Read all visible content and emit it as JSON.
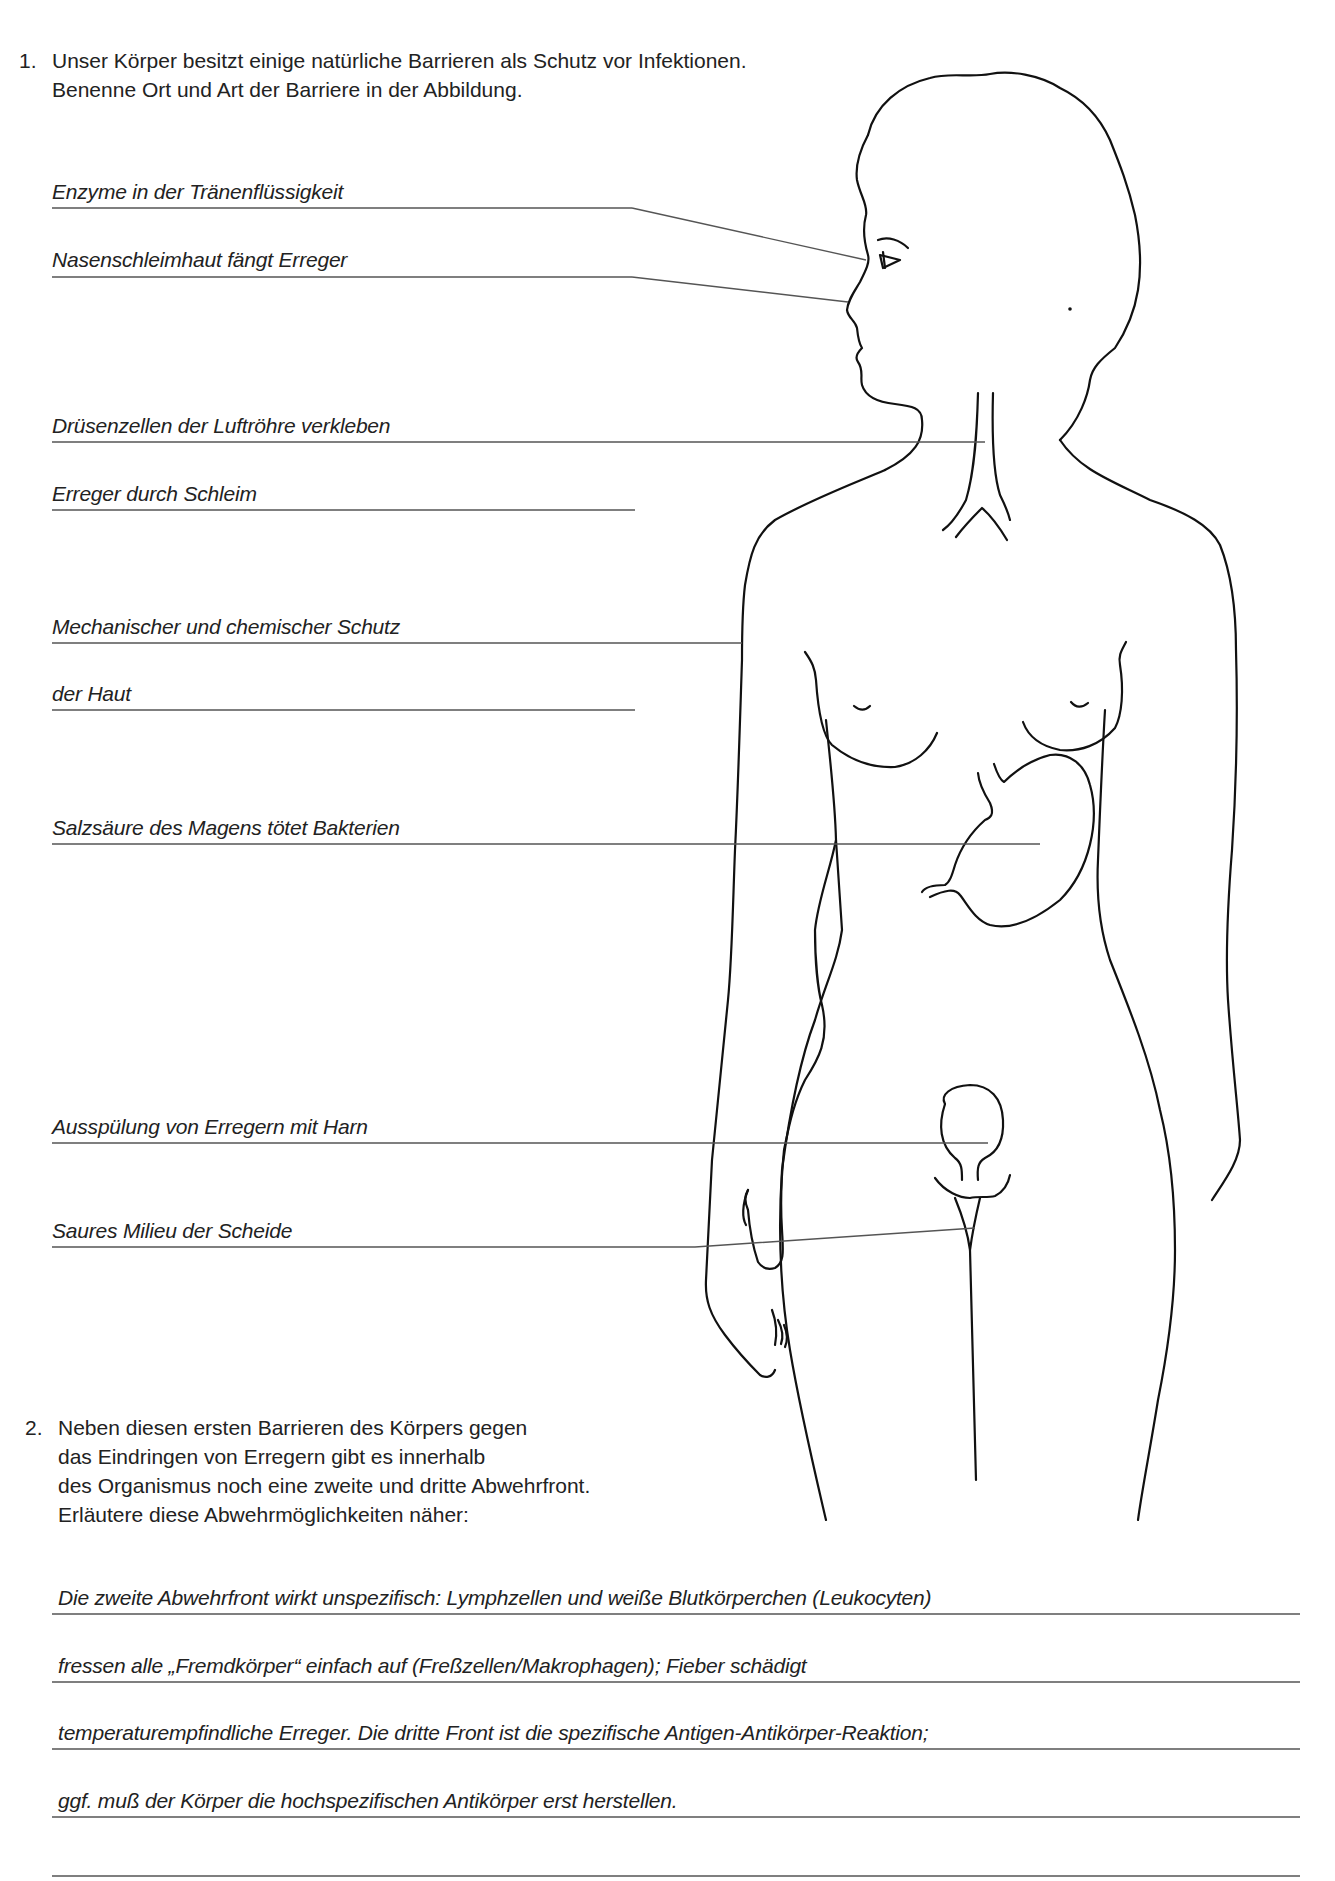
{
  "task1": {
    "number": "1.",
    "lines": [
      "Unser Körper besitzt einige natürliche Barrieren als Schutz vor Infektionen.",
      "Benenne Ort und Art der Barriere in der Abbildung."
    ],
    "answers": [
      "Enzyme in der Tränenflüssigkeit",
      "Nasenschleimhaut fängt Erreger",
      "Drüsenzellen der Luftröhre verkleben",
      "Erreger durch Schleim",
      "Mechanischer und chemischer Schutz",
      "der Haut",
      "Salzsäure des Magens tötet Bakterien",
      "Ausspülung von Erregern mit Harn",
      "Saures Milieu der Scheide"
    ]
  },
  "task2": {
    "number": "2.",
    "lines": [
      "Neben diesen ersten Barrieren des Körpers gegen",
      "das Eindringen von Erregern gibt es innerhalb",
      "des Organismus noch eine zweite und dritte Abwehrfront.",
      "Erläutere diese Abwehrmöglichkeiten näher:"
    ],
    "answers": [
      "Die zweite Abwehrfront wirkt unspezifisch: Lymphzellen und weiße Blutkörperchen (Leukocyten)",
      "fressen alle „Fremdkörper“ einfach auf (Freßzellen/Makrophagen); Fieber schädigt",
      "temperaturempfindliche Erreger. Die dritte Front ist die spezifische Antigen-Antikörper-Reaktion;",
      "ggf. muß der Körper die hochspezifischen Antikörper erst herstellen.",
      ""
    ]
  },
  "figure": {
    "line_color": "#111111",
    "label_line_color": "#555555"
  }
}
